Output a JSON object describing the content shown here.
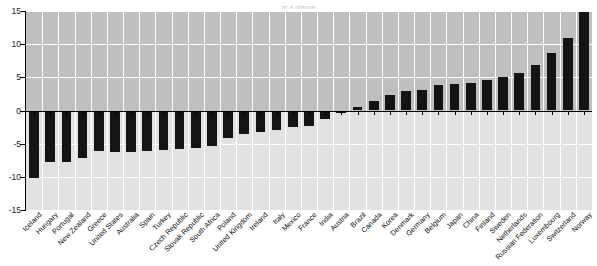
{
  "figure": {
    "title_partial": "at a glance",
    "background": "#ffffff",
    "plot_band_positive_color": "#bfbfbf",
    "plot_band_negative_color": "#e2e2e2",
    "bar_color": "#141414",
    "gridline_color": "#ffffff",
    "axis_color": "#000000"
  },
  "axis": {
    "y_ticks": [
      "15",
      "10",
      "5",
      "0",
      "-5",
      "-10",
      "-15"
    ],
    "y_min": -15,
    "y_max": 15,
    "y_tick_step": 5
  },
  "chart_data": {
    "type": "bar",
    "title": "at a glance",
    "xlabel": "",
    "ylabel": "",
    "ylim": [
      -15,
      15
    ],
    "ytick_step": 5,
    "grid": true,
    "legend": "none",
    "orientation": "vertical",
    "sorted": "ascending",
    "categories": [
      "Iceland",
      "Hungary",
      "Portugal",
      "New Zealand",
      "Greece",
      "United States",
      "Australia",
      "Spain",
      "Turkey",
      "Czech Republic",
      "Slovak Republic",
      "South Africa",
      "Poland",
      "United Kingdom",
      "Ireland",
      "Italy",
      "Mexico",
      "France",
      "India",
      "Austria",
      "Brazil",
      "Canada",
      "Korea",
      "Denmark",
      "Germany",
      "Belgium",
      "Japan",
      "China",
      "Finland",
      "Sweden",
      "Netherlands",
      "Russian Federation",
      "Luxembourg",
      "Switzerland",
      "Norway"
    ],
    "values": [
      -10.2,
      -7.8,
      -7.7,
      -7.1,
      -6.1,
      -6.2,
      -6.2,
      -6.1,
      -5.9,
      -5.8,
      -5.6,
      -5.4,
      -4.2,
      -3.6,
      -3.3,
      -2.9,
      -2.5,
      -2.3,
      -1.3,
      -0.4,
      0.6,
      1.5,
      2.3,
      3.0,
      3.1,
      3.9,
      4.0,
      4.2,
      4.6,
      5.0,
      5.6,
      6.9,
      8.6,
      11.0,
      14.8
    ]
  }
}
